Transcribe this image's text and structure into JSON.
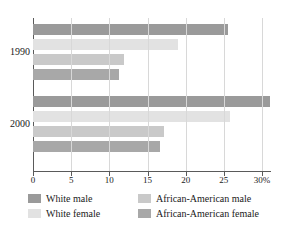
{
  "chart_data": {
    "type": "bar",
    "orientation": "horizontal",
    "title": "",
    "xlabel": "",
    "ylabel": "",
    "categories": [
      "1990",
      "2000"
    ],
    "xlim": [
      0,
      30
    ],
    "xticks": [
      0,
      5,
      10,
      15,
      20,
      25,
      30
    ],
    "xtick_labels": [
      "0",
      "5",
      "10",
      "15",
      "20",
      "25",
      "30%"
    ],
    "grid": true,
    "legend_position": "bottom",
    "series": [
      {
        "name": "White male",
        "color": "#9a9a9a",
        "values": [
          25.5,
          31.0
        ]
      },
      {
        "name": "White female",
        "color": "#e2e2e2",
        "values": [
          19.0,
          25.8
        ]
      },
      {
        "name": "African-American male",
        "color": "#c9c9c9",
        "values": [
          11.9,
          17.2
        ]
      },
      {
        "name": "African-American female",
        "color": "#a8a8a8",
        "values": [
          11.3,
          16.6
        ]
      }
    ]
  },
  "axis": {
    "ticks": [
      {
        "value": 0,
        "label": "0"
      },
      {
        "value": 5,
        "label": "5"
      },
      {
        "value": 10,
        "label": "10"
      },
      {
        "value": 15,
        "label": "15"
      },
      {
        "value": 20,
        "label": "20"
      },
      {
        "value": 25,
        "label": "25"
      },
      {
        "value": 30,
        "label": "30%"
      }
    ]
  },
  "groups": [
    {
      "label": "1990"
    },
    {
      "label": "2000"
    }
  ],
  "legend": {
    "items": [
      {
        "label": "White male",
        "color": "#9a9a9a"
      },
      {
        "label": "African-American male",
        "color": "#c9c9c9"
      },
      {
        "label": "White female",
        "color": "#e2e2e2"
      },
      {
        "label": "African-American female",
        "color": "#a8a8a8"
      }
    ]
  }
}
